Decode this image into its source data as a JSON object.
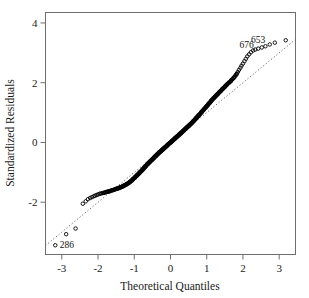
{
  "chart_data": {
    "type": "scatter",
    "title": "",
    "xlabel": "Theoretical Quantiles",
    "ylabel": "Standardized Residuals",
    "xlim": [
      -3.45,
      3.45
    ],
    "ylim": [
      -3.75,
      4.35
    ],
    "xticks": [
      -3,
      -2,
      -1,
      0,
      1,
      2,
      3
    ],
    "xtick_labels": [
      "-3",
      "-2",
      "-1",
      "0",
      "1",
      "2",
      "3"
    ],
    "yticks": [
      -2,
      0,
      2,
      4
    ],
    "ytick_labels": [
      "-2",
      "0",
      "2",
      "4"
    ],
    "grid": false,
    "legend": "none",
    "marker": "open-circle",
    "reference_line": {
      "style": "dotted",
      "slope": 1.0,
      "intercept": 0.0,
      "x_from": -3.45,
      "x_to": 3.45
    },
    "annotations": [
      {
        "label": "676",
        "x": 2.42,
        "y": 3.11
      },
      {
        "label": "653",
        "x": 2.74,
        "y": 3.28
      },
      {
        "label": "286",
        "x": -3.18,
        "y": -3.44
      }
    ],
    "series": [
      {
        "name": "standardized residuals",
        "x": [
          -3.18,
          -2.88,
          -2.62,
          -2.42,
          -2.34,
          -2.28,
          -2.22,
          -2.17,
          -2.12,
          -2.08,
          -2.04,
          -2.0,
          -1.96,
          -1.93,
          -1.89,
          -1.86,
          -1.83,
          -1.8,
          -1.77,
          -1.74,
          -1.71,
          -1.68,
          -1.66,
          -1.63,
          -1.61,
          -1.58,
          -1.56,
          -1.53,
          -1.51,
          -1.49,
          -1.46,
          -1.44,
          -1.42,
          -1.4,
          -1.38,
          -1.36,
          -1.34,
          -1.32,
          -1.3,
          -1.28,
          -1.26,
          -1.24,
          -1.22,
          -1.2,
          -1.18,
          -1.16,
          -1.14,
          -1.12,
          -1.11,
          -1.09,
          -1.07,
          -1.05,
          -1.04,
          -1.02,
          -1.0,
          -0.98,
          -0.97,
          -0.95,
          -0.93,
          -0.92,
          -0.9,
          -0.88,
          -0.87,
          -0.85,
          -0.84,
          -0.82,
          -0.8,
          -0.79,
          -0.77,
          -0.76,
          -0.74,
          -0.73,
          -0.71,
          -0.7,
          -0.68,
          -0.67,
          -0.65,
          -0.64,
          -0.62,
          -0.61,
          -0.59,
          -0.58,
          -0.56,
          -0.55,
          -0.53,
          -0.52,
          -0.5,
          -0.49,
          -0.47,
          -0.46,
          -0.45,
          -0.43,
          -0.42,
          -0.4,
          -0.39,
          -0.38,
          -0.36,
          -0.35,
          -0.33,
          -0.32,
          -0.31,
          -0.29,
          -0.28,
          -0.26,
          -0.25,
          -0.24,
          -0.22,
          -0.21,
          -0.2,
          -0.18,
          -0.17,
          -0.15,
          -0.14,
          -0.13,
          -0.11,
          -0.1,
          -0.09,
          -0.07,
          -0.06,
          -0.05,
          -0.03,
          -0.02,
          0.0,
          0.01,
          0.03,
          0.04,
          0.05,
          0.07,
          0.08,
          0.09,
          0.11,
          0.12,
          0.13,
          0.15,
          0.16,
          0.18,
          0.19,
          0.2,
          0.22,
          0.23,
          0.24,
          0.26,
          0.27,
          0.29,
          0.3,
          0.31,
          0.33,
          0.34,
          0.36,
          0.37,
          0.38,
          0.4,
          0.41,
          0.43,
          0.44,
          0.46,
          0.47,
          0.49,
          0.5,
          0.52,
          0.53,
          0.55,
          0.56,
          0.58,
          0.59,
          0.61,
          0.62,
          0.64,
          0.65,
          0.67,
          0.68,
          0.7,
          0.71,
          0.73,
          0.74,
          0.76,
          0.77,
          0.79,
          0.8,
          0.82,
          0.84,
          0.85,
          0.87,
          0.88,
          0.9,
          0.92,
          0.93,
          0.95,
          0.97,
          0.98,
          1.0,
          1.02,
          1.04,
          1.05,
          1.07,
          1.09,
          1.11,
          1.12,
          1.14,
          1.16,
          1.18,
          1.2,
          1.22,
          1.24,
          1.26,
          1.28,
          1.3,
          1.32,
          1.34,
          1.36,
          1.38,
          1.4,
          1.42,
          1.44,
          1.46,
          1.49,
          1.51,
          1.53,
          1.56,
          1.58,
          1.61,
          1.63,
          1.66,
          1.68,
          1.71,
          1.74,
          1.77,
          1.8,
          1.83,
          1.86,
          1.89,
          1.93,
          1.96,
          2.0,
          2.04,
          2.08,
          2.12,
          2.17,
          2.22,
          2.28,
          2.34,
          2.42,
          2.52,
          2.62,
          2.74,
          2.88,
          3.18
        ],
        "y": [
          -3.44,
          -3.07,
          -2.88,
          -2.05,
          -1.97,
          -1.9,
          -1.86,
          -1.83,
          -1.8,
          -1.78,
          -1.76,
          -1.74,
          -1.72,
          -1.71,
          -1.7,
          -1.69,
          -1.68,
          -1.67,
          -1.66,
          -1.65,
          -1.64,
          -1.63,
          -1.62,
          -1.61,
          -1.6,
          -1.59,
          -1.58,
          -1.57,
          -1.56,
          -1.55,
          -1.54,
          -1.53,
          -1.52,
          -1.51,
          -1.5,
          -1.49,
          -1.48,
          -1.47,
          -1.46,
          -1.44,
          -1.43,
          -1.42,
          -1.4,
          -1.39,
          -1.37,
          -1.36,
          -1.34,
          -1.32,
          -1.31,
          -1.29,
          -1.27,
          -1.25,
          -1.23,
          -1.21,
          -1.19,
          -1.17,
          -1.15,
          -1.13,
          -1.11,
          -1.09,
          -1.07,
          -1.05,
          -1.03,
          -1.01,
          -0.99,
          -0.97,
          -0.95,
          -0.93,
          -0.91,
          -0.89,
          -0.87,
          -0.85,
          -0.83,
          -0.81,
          -0.79,
          -0.77,
          -0.75,
          -0.73,
          -0.71,
          -0.69,
          -0.67,
          -0.66,
          -0.64,
          -0.62,
          -0.6,
          -0.58,
          -0.57,
          -0.55,
          -0.53,
          -0.51,
          -0.5,
          -0.48,
          -0.46,
          -0.45,
          -0.43,
          -0.41,
          -0.4,
          -0.38,
          -0.36,
          -0.35,
          -0.33,
          -0.32,
          -0.3,
          -0.29,
          -0.27,
          -0.26,
          -0.24,
          -0.23,
          -0.21,
          -0.2,
          -0.18,
          -0.17,
          -0.15,
          -0.14,
          -0.12,
          -0.11,
          -0.09,
          -0.08,
          -0.06,
          -0.05,
          -0.03,
          -0.02,
          0.0,
          0.01,
          0.03,
          0.04,
          0.06,
          0.07,
          0.09,
          0.1,
          0.12,
          0.13,
          0.15,
          0.16,
          0.18,
          0.19,
          0.21,
          0.22,
          0.24,
          0.25,
          0.27,
          0.28,
          0.3,
          0.31,
          0.33,
          0.34,
          0.36,
          0.38,
          0.39,
          0.41,
          0.42,
          0.44,
          0.46,
          0.47,
          0.49,
          0.51,
          0.52,
          0.54,
          0.56,
          0.57,
          0.59,
          0.61,
          0.63,
          0.64,
          0.66,
          0.68,
          0.7,
          0.72,
          0.74,
          0.76,
          0.78,
          0.8,
          0.82,
          0.84,
          0.86,
          0.88,
          0.9,
          0.92,
          0.94,
          0.96,
          0.99,
          1.01,
          1.03,
          1.05,
          1.08,
          1.1,
          1.12,
          1.15,
          1.17,
          1.19,
          1.22,
          1.24,
          1.27,
          1.29,
          1.32,
          1.34,
          1.37,
          1.39,
          1.42,
          1.44,
          1.47,
          1.49,
          1.52,
          1.54,
          1.57,
          1.59,
          1.62,
          1.64,
          1.67,
          1.69,
          1.72,
          1.74,
          1.77,
          1.79,
          1.82,
          1.85,
          1.88,
          1.91,
          1.94,
          1.97,
          2.0,
          2.02,
          2.05,
          2.08,
          2.12,
          2.16,
          2.2,
          2.25,
          2.3,
          2.36,
          2.43,
          2.5,
          2.57,
          2.64,
          2.72,
          2.8,
          2.88,
          2.95,
          3.02,
          3.08,
          3.11,
          3.14,
          3.18,
          3.22,
          3.28,
          3.34,
          3.42
        ]
      }
    ]
  }
}
